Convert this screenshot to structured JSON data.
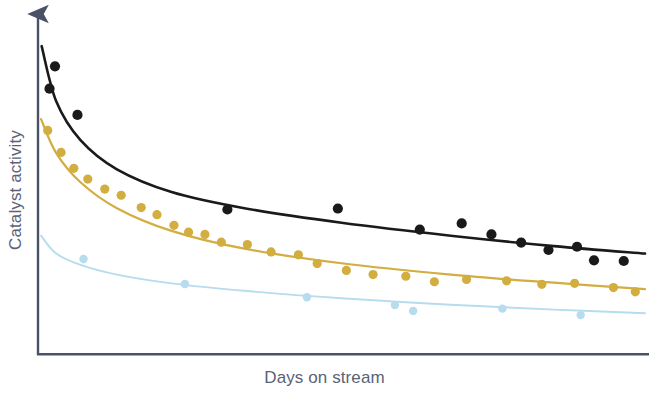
{
  "figure": {
    "background_color": "#ffffff",
    "width": 649,
    "height": 393
  },
  "axes": {
    "color": "#5a6275",
    "x_label": "Days on stream",
    "y_label": "Catalyst activity",
    "y_arrow": true,
    "tick_labels": false,
    "gridlines": false
  },
  "chart_data": {
    "type": "scatter",
    "title": "",
    "xlabel": "Days on stream",
    "ylabel": "Catalyst activity",
    "xlim": [
      0,
      100
    ],
    "ylim": [
      0,
      100
    ],
    "grid": false,
    "legend": "none",
    "axis_ticks": "none",
    "series": [
      {
        "name": "Catalyst A",
        "color": "#1a1a1a",
        "marker": "filled-circle",
        "curve": "power-law decay",
        "points": [
          {
            "x": 2.8,
            "y": 88.8
          },
          {
            "x": 1.9,
            "y": 81.9
          },
          {
            "x": 6.5,
            "y": 73.8
          },
          {
            "x": 31.2,
            "y": 44.6
          },
          {
            "x": 49.4,
            "y": 44.9
          },
          {
            "x": 62.9,
            "y": 38.4
          },
          {
            "x": 69.8,
            "y": 40.3
          },
          {
            "x": 74.7,
            "y": 36.9
          },
          {
            "x": 79.6,
            "y": 34.4
          },
          {
            "x": 84.1,
            "y": 32.1
          },
          {
            "x": 88.8,
            "y": 33.1
          },
          {
            "x": 91.6,
            "y": 28.9
          },
          {
            "x": 96.5,
            "y": 28.7
          }
        ],
        "curve_points": [
          {
            "x": 0.6,
            "y": 95.0
          },
          {
            "x": 3.0,
            "y": 78.0
          },
          {
            "x": 7.0,
            "y": 66.0
          },
          {
            "x": 13.0,
            "y": 57.0
          },
          {
            "x": 22.0,
            "y": 50.0
          },
          {
            "x": 34.0,
            "y": 45.0
          },
          {
            "x": 50.0,
            "y": 40.5
          },
          {
            "x": 68.0,
            "y": 36.5
          },
          {
            "x": 85.0,
            "y": 33.3
          },
          {
            "x": 100.0,
            "y": 31.0
          }
        ]
      },
      {
        "name": "Catalyst B",
        "color": "#d2ad3f",
        "marker": "filled-circle",
        "curve": "power-law decay",
        "points": [
          {
            "x": 1.6,
            "y": 69.0
          },
          {
            "x": 3.8,
            "y": 62.2
          },
          {
            "x": 5.9,
            "y": 57.3
          },
          {
            "x": 8.2,
            "y": 54.0
          },
          {
            "x": 11.0,
            "y": 50.9
          },
          {
            "x": 13.7,
            "y": 49.0
          },
          {
            "x": 17.0,
            "y": 45.2
          },
          {
            "x": 19.6,
            "y": 43.0
          },
          {
            "x": 22.4,
            "y": 39.7
          },
          {
            "x": 24.8,
            "y": 37.6
          },
          {
            "x": 27.5,
            "y": 36.9
          },
          {
            "x": 30.2,
            "y": 34.5
          },
          {
            "x": 34.5,
            "y": 33.8
          },
          {
            "x": 38.4,
            "y": 31.5
          },
          {
            "x": 42.9,
            "y": 30.6
          },
          {
            "x": 46.0,
            "y": 27.9
          },
          {
            "x": 50.8,
            "y": 25.8
          },
          {
            "x": 55.2,
            "y": 24.5
          },
          {
            "x": 60.6,
            "y": 24.0
          },
          {
            "x": 65.3,
            "y": 22.3
          },
          {
            "x": 70.6,
            "y": 23.0
          },
          {
            "x": 77.2,
            "y": 22.6
          },
          {
            "x": 83.0,
            "y": 21.5
          },
          {
            "x": 88.4,
            "y": 21.8
          },
          {
            "x": 94.8,
            "y": 20.5
          },
          {
            "x": 98.4,
            "y": 19.2
          }
        ],
        "curve_points": [
          {
            "x": 0.5,
            "y": 72.5
          },
          {
            "x": 3.0,
            "y": 62.0
          },
          {
            "x": 7.0,
            "y": 53.0
          },
          {
            "x": 13.0,
            "y": 45.0
          },
          {
            "x": 22.0,
            "y": 38.0
          },
          {
            "x": 34.0,
            "y": 32.5
          },
          {
            "x": 50.0,
            "y": 28.0
          },
          {
            "x": 68.0,
            "y": 24.5
          },
          {
            "x": 85.0,
            "y": 22.0
          },
          {
            "x": 100.0,
            "y": 20.0
          }
        ]
      },
      {
        "name": "Catalyst C",
        "color": "#b6dced",
        "marker": "filled-circle",
        "curve": "power-law decay",
        "points": [
          {
            "x": 7.5,
            "y": 29.3
          },
          {
            "x": 24.2,
            "y": 21.6
          },
          {
            "x": 44.3,
            "y": 17.5
          },
          {
            "x": 58.8,
            "y": 15.1
          },
          {
            "x": 61.8,
            "y": 13.3
          },
          {
            "x": 76.5,
            "y": 14.0
          },
          {
            "x": 89.4,
            "y": 12.0
          }
        ],
        "curve_points": [
          {
            "x": 0.5,
            "y": 36.5
          },
          {
            "x": 3.0,
            "y": 31.0
          },
          {
            "x": 7.0,
            "y": 27.5
          },
          {
            "x": 13.0,
            "y": 24.5
          },
          {
            "x": 22.0,
            "y": 21.8
          },
          {
            "x": 34.0,
            "y": 19.5
          },
          {
            "x": 50.0,
            "y": 17.2
          },
          {
            "x": 68.0,
            "y": 15.2
          },
          {
            "x": 85.0,
            "y": 13.7
          },
          {
            "x": 100.0,
            "y": 12.6
          }
        ]
      }
    ]
  }
}
